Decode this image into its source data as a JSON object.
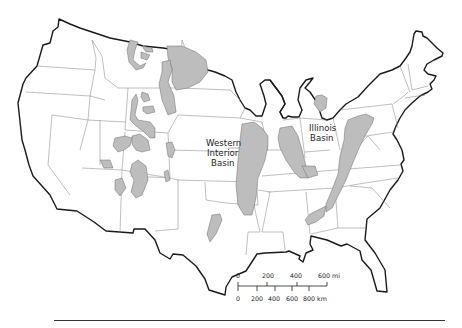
{
  "map": {
    "subject": "Conterminous United States with shaded sedimentary basin regions",
    "labels": {
      "western_interior_basin": [
        "Western",
        "Interior",
        "Basin"
      ],
      "illinois_basin": [
        "Illinois",
        "Basin"
      ]
    },
    "shaded_area_color": "#bdbdbd",
    "state_boundary_color": "#8a8a8a",
    "national_outline_color": "#1a1a1a"
  },
  "scale_bar": {
    "miles": {
      "ticks": [
        "0",
        "200",
        "400",
        "600 mi"
      ]
    },
    "kilometers": {
      "ticks": [
        "0",
        "200",
        "400",
        "600",
        "800 km"
      ]
    }
  }
}
